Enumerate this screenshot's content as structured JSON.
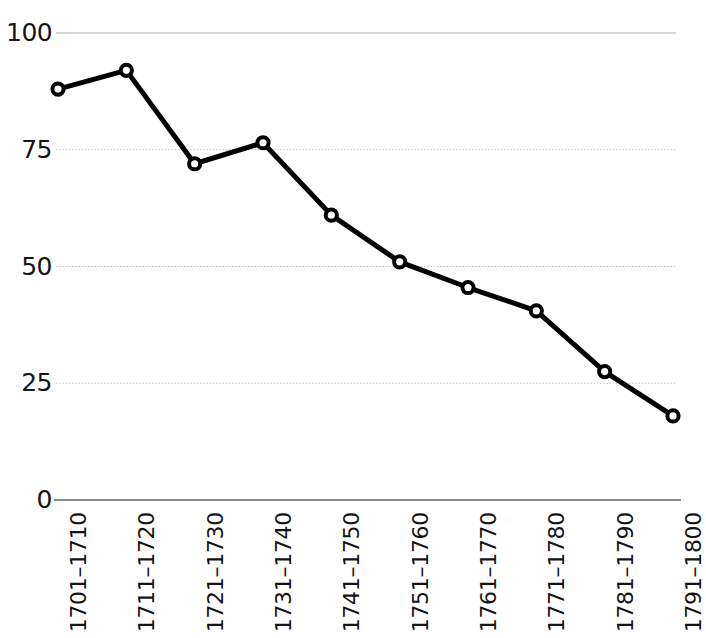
{
  "chart_data": {
    "type": "line",
    "title": "",
    "subtitle": "",
    "xlabel": "",
    "ylabel": "",
    "categories": [
      "1701–1710",
      "1711–1720",
      "1721–1730",
      "1731–1740",
      "1741–1750",
      "1751–1760",
      "1761–1770",
      "1771–1780",
      "1781–1790",
      "1791–1800"
    ],
    "values": [
      88,
      92,
      72,
      76.5,
      61,
      51,
      45.5,
      40.5,
      27.5,
      18
    ],
    "series": [
      {
        "name": "",
        "values": [
          88,
          92,
          72,
          76.5,
          61,
          51,
          45.5,
          40.5,
          27.5,
          18
        ]
      }
    ],
    "ylim": [
      0,
      100
    ],
    "yticks": [
      0,
      25,
      50,
      75,
      100
    ],
    "ytick_labels": [
      "0",
      "25",
      "50",
      "75",
      "100"
    ],
    "grid": true,
    "grid_axis": "y",
    "legend": "none",
    "marker": "open-circle",
    "line_color": "#000000",
    "grid_color": "#c8c8c8",
    "axis_color": "#8a8a8a",
    "background_color": "#ffffff",
    "xtick_rotation": -90
  },
  "axes": {
    "y_ticks": [
      {
        "label": "100",
        "value": 100
      },
      {
        "label": "75",
        "value": 75
      },
      {
        "label": "50",
        "value": 50
      },
      {
        "label": "25",
        "value": 25
      },
      {
        "label": "0",
        "value": 0
      }
    ],
    "x_ticks": [
      {
        "label": "1701–1710"
      },
      {
        "label": "1711–1720"
      },
      {
        "label": "1721–1730"
      },
      {
        "label": "1731–1740"
      },
      {
        "label": "1741–1750"
      },
      {
        "label": "1751–1760"
      },
      {
        "label": "1761–1770"
      },
      {
        "label": "1771–1780"
      },
      {
        "label": "1781–1790"
      },
      {
        "label": "1791–1800"
      }
    ]
  }
}
